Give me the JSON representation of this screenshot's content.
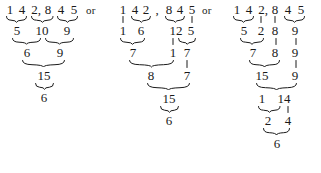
{
  "figure": {
    "kind": "arithmetic-digit-grouping-diagram",
    "subject_number": "142,845",
    "connector": "or",
    "ink_color": "#1a1a1a",
    "background_color": "#ffffff"
  },
  "connectors": [
    {
      "label": "or"
    },
    {
      "label": "or"
    }
  ],
  "columns": [
    {
      "name": "variant-1",
      "rows": [
        {
          "name": "row-digits",
          "tokens": [
            "1",
            "4",
            "2,",
            "8",
            "4",
            "5"
          ]
        },
        {
          "name": "row-sums-1",
          "tokens": [
            "5",
            "10",
            "9"
          ]
        },
        {
          "name": "row-sums-2",
          "tokens": [
            "6",
            "9"
          ]
        },
        {
          "name": "row-sums-3",
          "tokens": [
            "15"
          ]
        },
        {
          "name": "row-result",
          "tokens": [
            "6"
          ]
        }
      ]
    },
    {
      "name": "variant-2",
      "rows": [
        {
          "name": "row-digits",
          "tokens": [
            "1",
            "4",
            "2",
            ",",
            "8",
            "4",
            "5"
          ]
        },
        {
          "name": "row-sums-1",
          "tokens": [
            "1",
            "6",
            "12",
            "5"
          ]
        },
        {
          "name": "row-sums-2",
          "tokens": [
            "7",
            "1",
            "7"
          ]
        },
        {
          "name": "row-sums-3",
          "tokens": [
            "8",
            "7"
          ]
        },
        {
          "name": "row-sums-4",
          "tokens": [
            "15"
          ]
        },
        {
          "name": "row-result",
          "tokens": [
            "6"
          ]
        }
      ]
    },
    {
      "name": "variant-3",
      "rows": [
        {
          "name": "row-digits",
          "tokens": [
            "1",
            "4",
            "2,",
            "8",
            "4",
            "5"
          ]
        },
        {
          "name": "row-sums-1",
          "tokens": [
            "5",
            "2",
            "8",
            "9"
          ]
        },
        {
          "name": "row-sums-2",
          "tokens": [
            "7",
            "8",
            "9"
          ]
        },
        {
          "name": "row-sums-3",
          "tokens": [
            "15",
            "9"
          ]
        },
        {
          "name": "row-sums-4",
          "tokens": [
            "1",
            "14"
          ]
        },
        {
          "name": "row-sums-5",
          "tokens": [
            "2",
            "4"
          ]
        },
        {
          "name": "row-result",
          "tokens": [
            "6"
          ]
        }
      ]
    }
  ],
  "tokens": {
    "c1r1": [
      "1",
      "4",
      "2,",
      "8",
      "4",
      "5"
    ],
    "c1r2": [
      "5",
      "10",
      "9"
    ],
    "c1r3": [
      "6",
      "9"
    ],
    "c1r4": [
      "15"
    ],
    "c1r5": [
      "6"
    ],
    "c2r1": [
      "1",
      "4",
      "2",
      ",",
      "8",
      "4",
      "5"
    ],
    "c2r2": [
      "1",
      "6",
      "12",
      "5"
    ],
    "c2r3": [
      "7",
      "1",
      "7"
    ],
    "c2r4": [
      "8",
      "7"
    ],
    "c2r5": [
      "15"
    ],
    "c2r6": [
      "6"
    ],
    "c3r1": [
      "1",
      "4",
      "2,",
      "8",
      "4",
      "5"
    ],
    "c3r2": [
      "5",
      "2",
      "8",
      "9"
    ],
    "c3r3": [
      "7",
      "8",
      "9"
    ],
    "c3r4": [
      "15",
      "9"
    ],
    "c3r5": [
      "1",
      "14"
    ],
    "c3r6": [
      "2",
      "4"
    ],
    "c3r7": [
      "6"
    ]
  }
}
